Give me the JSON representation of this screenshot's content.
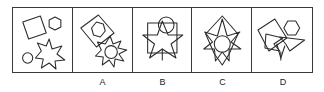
{
  "figure": {
    "type": "visual-analogy-multiple-choice",
    "stroke_color": "#2b2b2b",
    "background_color": "#ffffff",
    "frame_color": "#3a3a3a"
  },
  "stem_panel": {
    "name": "stem-panel",
    "shapes": [
      {
        "id": "square",
        "label": "rotated square",
        "position": "upper-left"
      },
      {
        "id": "hexagon",
        "label": "hexagon",
        "position": "upper-right"
      },
      {
        "id": "burst",
        "label": "six-point burst star",
        "position": "lower-right"
      },
      {
        "id": "circle",
        "label": "small circle",
        "position": "lower-left"
      }
    ]
  },
  "options": [
    {
      "key": "A",
      "label": "A",
      "shapes": [
        {
          "id": "square",
          "label": "rotated square",
          "position": "upper-left"
        },
        {
          "id": "hexagon",
          "label": "hexagon",
          "position": "inside square"
        },
        {
          "id": "burst",
          "label": "spiky burst star",
          "position": "lower-right"
        },
        {
          "id": "circle",
          "label": "small circle",
          "position": "inside burst"
        }
      ]
    },
    {
      "key": "B",
      "label": "B",
      "shapes": [
        {
          "id": "square",
          "label": "upright square",
          "position": "center"
        },
        {
          "id": "star",
          "label": "five-point star",
          "position": "inside square"
        },
        {
          "id": "circle",
          "label": "circle",
          "position": "overlapping top"
        }
      ]
    },
    {
      "key": "C",
      "label": "C",
      "shapes": [
        {
          "id": "kite",
          "label": "kite / diamond outline",
          "position": "center"
        },
        {
          "id": "burst",
          "label": "burst star",
          "position": "inside kite"
        },
        {
          "id": "circle",
          "label": "circle",
          "position": "center of burst"
        }
      ]
    },
    {
      "key": "D",
      "label": "D",
      "shapes": [
        {
          "id": "square",
          "label": "rotated square",
          "position": "left"
        },
        {
          "id": "hexagon",
          "label": "hexagon",
          "position": "upper-right"
        },
        {
          "id": "arrow-wedge",
          "label": "angular wedge",
          "position": "right"
        },
        {
          "id": "spike",
          "label": "spike",
          "position": "bottom"
        }
      ]
    }
  ]
}
